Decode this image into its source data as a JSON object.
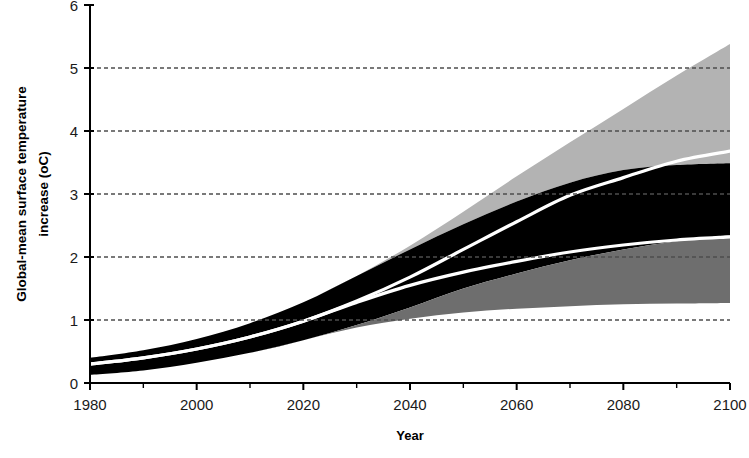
{
  "chart_data": {
    "type": "area",
    "title": "",
    "xlabel": "Year",
    "ylabel": "Global-mean surface temperature increase (oC)",
    "ylabel_line1": "Global-mean surface temperature",
    "ylabel_line2": "increase (oC)",
    "xlim": [
      1980,
      2100
    ],
    "ylim": [
      0,
      6
    ],
    "xticks_major": [
      1980,
      2000,
      2020,
      2040,
      2060,
      2080,
      2100
    ],
    "xticks_minor": [
      1990,
      2010,
      2030,
      2050,
      2070,
      2090
    ],
    "yticks": [
      0,
      1,
      2,
      3,
      4,
      5,
      6
    ],
    "xtick_labels": [
      "1980",
      "2000",
      "2020",
      "2040",
      "2060",
      "2080",
      "2100"
    ],
    "ytick_labels": [
      "0",
      "1",
      "2",
      "3",
      "4",
      "5",
      "6"
    ],
    "grid": "horizontal-dashed",
    "legend": "none",
    "x": [
      1980,
      1990,
      2000,
      2010,
      2020,
      2030,
      2040,
      2050,
      2060,
      2070,
      2080,
      2090,
      2100
    ],
    "series": [
      {
        "name": "high-scenario-upper-bound",
        "role": "light-gray-band-upper",
        "color": "#b3b3b3",
        "values": [
          0.4,
          0.52,
          0.7,
          0.95,
          1.28,
          1.7,
          2.18,
          2.72,
          3.28,
          3.82,
          4.35,
          4.88,
          5.38
        ]
      },
      {
        "name": "high-scenario-mean",
        "role": "white-line-upper",
        "color": "#ffffff",
        "values": [
          0.3,
          0.4,
          0.54,
          0.73,
          0.98,
          1.3,
          1.68,
          2.12,
          2.56,
          2.98,
          3.26,
          3.52,
          3.68
        ]
      },
      {
        "name": "mid-band-upper",
        "role": "black-band-upper",
        "color": "#000000",
        "values": [
          0.4,
          0.52,
          0.7,
          0.95,
          1.28,
          1.7,
          2.12,
          2.52,
          2.88,
          3.18,
          3.38,
          3.46,
          3.49
        ]
      },
      {
        "name": "mid-band-lower",
        "role": "black-band-lower",
        "color": "#000000",
        "values": [
          0.13,
          0.2,
          0.32,
          0.48,
          0.68,
          0.92,
          1.2,
          1.5,
          1.74,
          1.95,
          2.12,
          2.25,
          2.35
        ]
      },
      {
        "name": "low-scenario-mean",
        "role": "white-line-lower",
        "color": "#ffffff",
        "values": [
          0.3,
          0.4,
          0.54,
          0.73,
          0.98,
          1.28,
          1.55,
          1.76,
          1.93,
          2.08,
          2.19,
          2.27,
          2.32
        ]
      },
      {
        "name": "low-scenario-lower-bound",
        "role": "dark-gray-band-lower",
        "color": "#6e6e6e",
        "values": [
          0.13,
          0.2,
          0.32,
          0.48,
          0.68,
          0.88,
          1.02,
          1.12,
          1.18,
          1.22,
          1.25,
          1.26,
          1.27
        ]
      }
    ],
    "bands": [
      {
        "name": "light-gray-envelope",
        "fill": "#b3b3b3",
        "upper": "high-scenario-upper-bound",
        "lower": "mid-band-upper"
      },
      {
        "name": "black-envelope",
        "fill": "#000000",
        "upper": "mid-band-upper",
        "lower": "mid-band-lower"
      },
      {
        "name": "dark-gray-envelope",
        "fill": "#6e6e6e",
        "upper": "mid-band-lower",
        "lower": "low-scenario-lower-bound"
      }
    ],
    "colors": {
      "light_gray": "#b3b3b3",
      "dark_gray": "#6e6e6e",
      "black": "#000000",
      "white_line": "#ffffff",
      "axis": "#000000",
      "grid": "#4d4d4d"
    }
  }
}
